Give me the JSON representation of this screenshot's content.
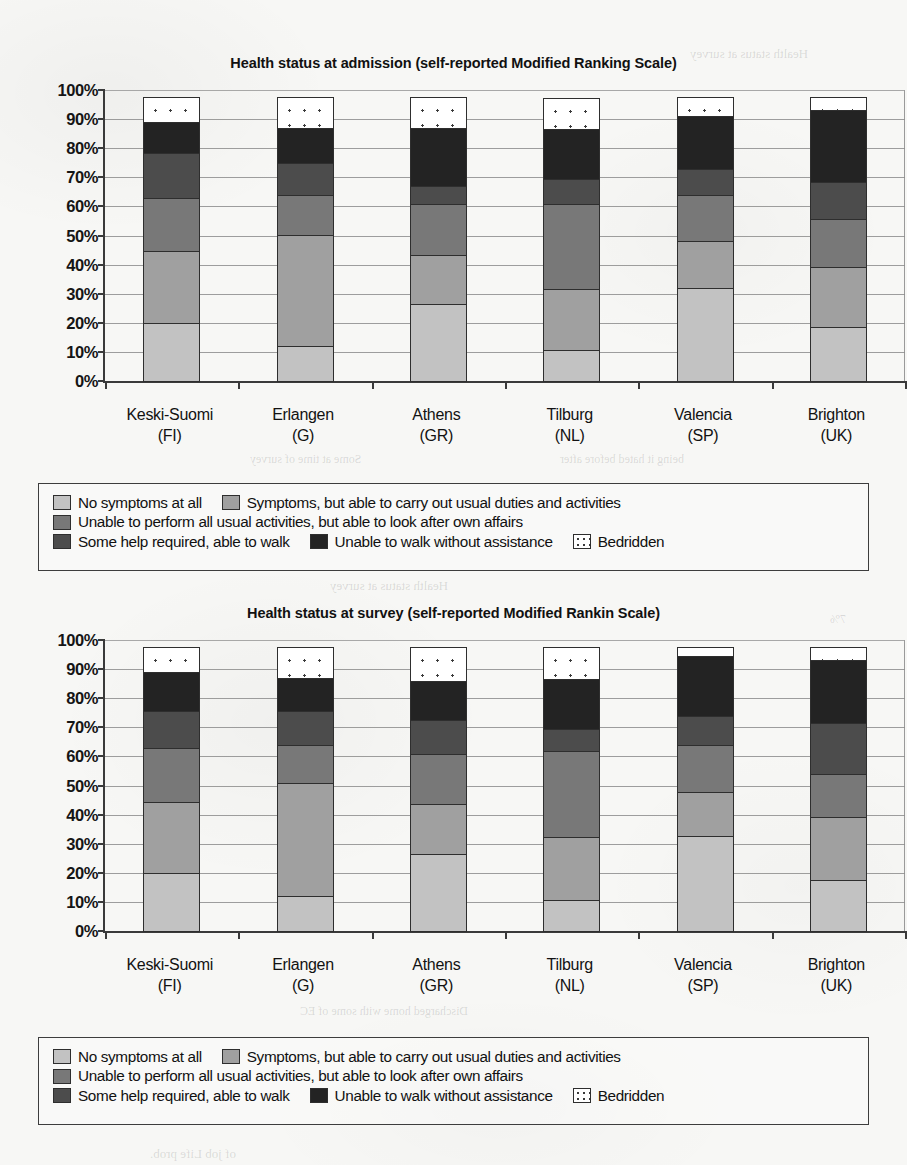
{
  "page": {
    "background_color": "#f7f7f5",
    "bleed_through_fragments": [
      {
        "text": "Health status at survey",
        "x": 690,
        "y": 46,
        "size": 13
      },
      {
        "text": "n",
        "x": 826,
        "y": 176,
        "size": 13
      },
      {
        "text": "Some at time of survey",
        "x": 250,
        "y": 452,
        "size": 12
      },
      {
        "text": "being it hated before after",
        "x": 560,
        "y": 452,
        "size": 12
      },
      {
        "text": "Health status at survey",
        "x": 330,
        "y": 578,
        "size": 13
      },
      {
        "text": "7%",
        "x": 830,
        "y": 612,
        "size": 12
      },
      {
        "text": "0",
        "x": 842,
        "y": 702,
        "size": 12
      },
      {
        "text": "0",
        "x": 842,
        "y": 758,
        "size": 12
      },
      {
        "text": "5",
        "x": 842,
        "y": 792,
        "size": 12
      },
      {
        "text": "0",
        "x": 842,
        "y": 826,
        "size": 12
      },
      {
        "text": "Discharged home with some of EC",
        "x": 300,
        "y": 1004,
        "size": 12
      },
      {
        "text": "of job Life prob.",
        "x": 150,
        "y": 1146,
        "size": 13
      }
    ]
  },
  "legend": {
    "items": [
      {
        "label": "No symptoms at all",
        "color": "#c2c2c2",
        "pattern": "solid"
      },
      {
        "label": "Symptoms, but able to carry out usual duties and activities",
        "color": "#a0a0a0",
        "pattern": "solid"
      },
      {
        "label": "Unable to perform all usual activities, but able to look after own affairs",
        "color": "#787878",
        "pattern": "solid"
      },
      {
        "label": "Some help required, able to walk",
        "color": "#4c4c4c",
        "pattern": "solid"
      },
      {
        "label": "Unable to walk without assistance",
        "color": "#232323",
        "pattern": "solid"
      },
      {
        "label": "Bedridden",
        "color": "#ffffff",
        "pattern": "dotted"
      }
    ],
    "row_layout": [
      [
        0,
        1
      ],
      [
        2
      ],
      [
        3,
        4,
        5
      ]
    ]
  },
  "chart_data": [
    {
      "id": "admission",
      "type": "bar",
      "bar_mode": "stacked-100-percent",
      "title": "Health status at admission (self-reported Modified Ranking Scale)",
      "xlabel": "",
      "ylabel": "",
      "ylim": [
        0,
        100
      ],
      "ytick_labels": [
        "0%",
        "10%",
        "20%",
        "30%",
        "40%",
        "50%",
        "60%",
        "70%",
        "80%",
        "90%",
        "100%"
      ],
      "ytick_values": [
        0,
        10,
        20,
        30,
        40,
        50,
        60,
        70,
        80,
        90,
        100
      ],
      "grid": true,
      "legend_position": "below",
      "categories": [
        "Keski-Suomi",
        "Erlangen",
        "Athens",
        "Tilburg",
        "Valencia",
        "Brighton"
      ],
      "category_sublabels": [
        "(FI)",
        "(G)",
        "(GR)",
        "(NL)",
        "(SP)",
        "(UK)"
      ],
      "series": [
        {
          "name": "No symptoms at all",
          "values": [
            20.5,
            12.5,
            27.0,
            11.0,
            32.5,
            19.0
          ]
        },
        {
          "name": "Symptoms, but able to carry out usual duties and activities",
          "values": [
            25.0,
            38.5,
            17.0,
            21.5,
            16.5,
            21.0
          ]
        },
        {
          "name": "Unable to perform all usual activities, but able to look after own affairs",
          "values": [
            18.5,
            14.0,
            18.0,
            29.5,
            16.0,
            17.0
          ]
        },
        {
          "name": "Some help required, able to walk",
          "values": [
            16.0,
            11.5,
            6.5,
            9.0,
            9.5,
            13.0
          ]
        },
        {
          "name": "Unable to walk without assistance",
          "values": [
            11.0,
            12.5,
            20.5,
            17.5,
            18.5,
            25.0
          ]
        },
        {
          "name": "Bedridden",
          "values": [
            9.0,
            11.0,
            11.0,
            11.0,
            7.0,
            5.0
          ]
        }
      ],
      "cumulative_boundaries": {
        "Keski-Suomi": [
          20.5,
          45.5,
          64.0,
          80.0,
          91.0,
          100
        ],
        "Erlangen": [
          12.5,
          51.0,
          65.0,
          76.5,
          89.0,
          100
        ],
        "Athens": [
          27.0,
          44.0,
          62.0,
          68.5,
          89.0,
          100
        ],
        "Tilburg": [
          11.0,
          32.5,
          62.0,
          71.0,
          88.5,
          100
        ],
        "Valencia": [
          32.5,
          49.0,
          65.0,
          74.5,
          93.0,
          100
        ],
        "Brighton": [
          19.0,
          40.0,
          57.0,
          70.0,
          95.0,
          100
        ]
      }
    },
    {
      "id": "survey",
      "type": "bar",
      "bar_mode": "stacked-100-percent",
      "title": "Health status at survey (self-reported Modified Rankin Scale)",
      "xlabel": "",
      "ylabel": "",
      "ylim": [
        0,
        100
      ],
      "ytick_labels": [
        "0%",
        "10%",
        "20%",
        "30%",
        "40%",
        "50%",
        "60%",
        "70%",
        "80%",
        "90%",
        "100%"
      ],
      "ytick_values": [
        0,
        10,
        20,
        30,
        40,
        50,
        60,
        70,
        80,
        90,
        100
      ],
      "grid": true,
      "legend_position": "below",
      "categories": [
        "Keski-Suomi",
        "Erlangen",
        "Athens",
        "Tilburg",
        "Valencia",
        "Brighton"
      ],
      "category_sublabels": [
        "(FI)",
        "(G)",
        "(GR)",
        "(NL)",
        "(SP)",
        "(UK)"
      ],
      "series": [
        {
          "name": "No symptoms at all",
          "values": [
            20.5,
            12.5,
            27.0,
            11.0,
            33.0,
            18.0
          ]
        },
        {
          "name": "Symptoms, but able to carry out usual duties and activities",
          "values": [
            24.5,
            39.0,
            17.5,
            22.0,
            15.5,
            22.0
          ]
        },
        {
          "name": "Unable to perform all usual activities, but able to look after own affairs",
          "values": [
            19.0,
            13.5,
            17.5,
            30.0,
            16.5,
            15.0
          ]
        },
        {
          "name": "Some help required, able to walk",
          "values": [
            13.0,
            12.0,
            12.0,
            8.0,
            10.5,
            18.0
          ]
        },
        {
          "name": "Unable to walk without assistance",
          "values": [
            14.0,
            12.0,
            14.0,
            17.5,
            21.0,
            22.0
          ]
        },
        {
          "name": "Bedridden",
          "values": [
            9.0,
            11.0,
            12.0,
            11.5,
            3.5,
            5.0
          ]
        }
      ],
      "cumulative_boundaries": {
        "Keski-Suomi": [
          20.5,
          45.0,
          64.0,
          77.0,
          91.0,
          100
        ],
        "Erlangen": [
          12.5,
          51.5,
          65.0,
          77.0,
          89.0,
          100
        ],
        "Athens": [
          27.0,
          44.5,
          62.0,
          74.0,
          88.0,
          100
        ],
        "Tilburg": [
          11.0,
          33.0,
          63.0,
          71.0,
          88.5,
          100
        ],
        "Valencia": [
          33.0,
          48.5,
          65.0,
          75.5,
          96.5,
          100
        ],
        "Brighton": [
          18.0,
          40.0,
          55.0,
          73.0,
          95.0,
          100
        ]
      }
    }
  ]
}
